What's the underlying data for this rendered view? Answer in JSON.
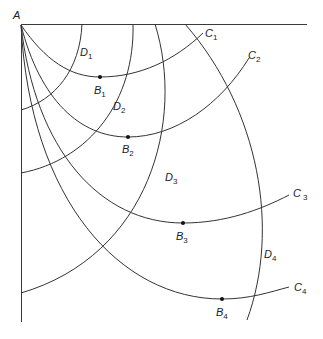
{
  "diagram": {
    "origin_label": "A",
    "curves_C": [
      {
        "name": "C",
        "sub": "1",
        "point": {
          "name": "B",
          "sub": "1"
        }
      },
      {
        "name": "C",
        "sub": "2",
        "point": {
          "name": "B",
          "sub": "2"
        }
      },
      {
        "name": "C",
        "sub": "3",
        "point": {
          "name": "B",
          "sub": "3"
        }
      },
      {
        "name": "C",
        "sub": "4",
        "point": {
          "name": "B",
          "sub": "4"
        }
      }
    ],
    "arcs_D": [
      {
        "name": "D",
        "sub": "1"
      },
      {
        "name": "D",
        "sub": "2"
      },
      {
        "name": "D",
        "sub": "3"
      },
      {
        "name": "D",
        "sub": "4"
      }
    ],
    "colors": {
      "stroke": "#333333",
      "background": "#ffffff"
    }
  }
}
